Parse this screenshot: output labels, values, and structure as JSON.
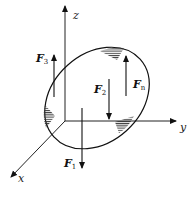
{
  "diagram": {
    "type": "3d-force-body",
    "axes": {
      "z": {
        "label": "z"
      },
      "y": {
        "label": "y"
      },
      "x": {
        "label": "x"
      }
    },
    "forces": [
      {
        "id": "F3",
        "base": "F",
        "sub": "3",
        "direction": "up"
      },
      {
        "id": "F2",
        "base": "F",
        "sub": "2",
        "direction": "down"
      },
      {
        "id": "Fn",
        "base": "F",
        "sub": "n",
        "direction": "up"
      },
      {
        "id": "F1",
        "base": "F",
        "sub": "1",
        "direction": "down"
      }
    ],
    "body": {
      "shape": "tilted-ellipse",
      "supports": 3
    },
    "colors": {
      "stroke": "#111111",
      "axis": "#222222",
      "background": "#ffffff"
    }
  }
}
